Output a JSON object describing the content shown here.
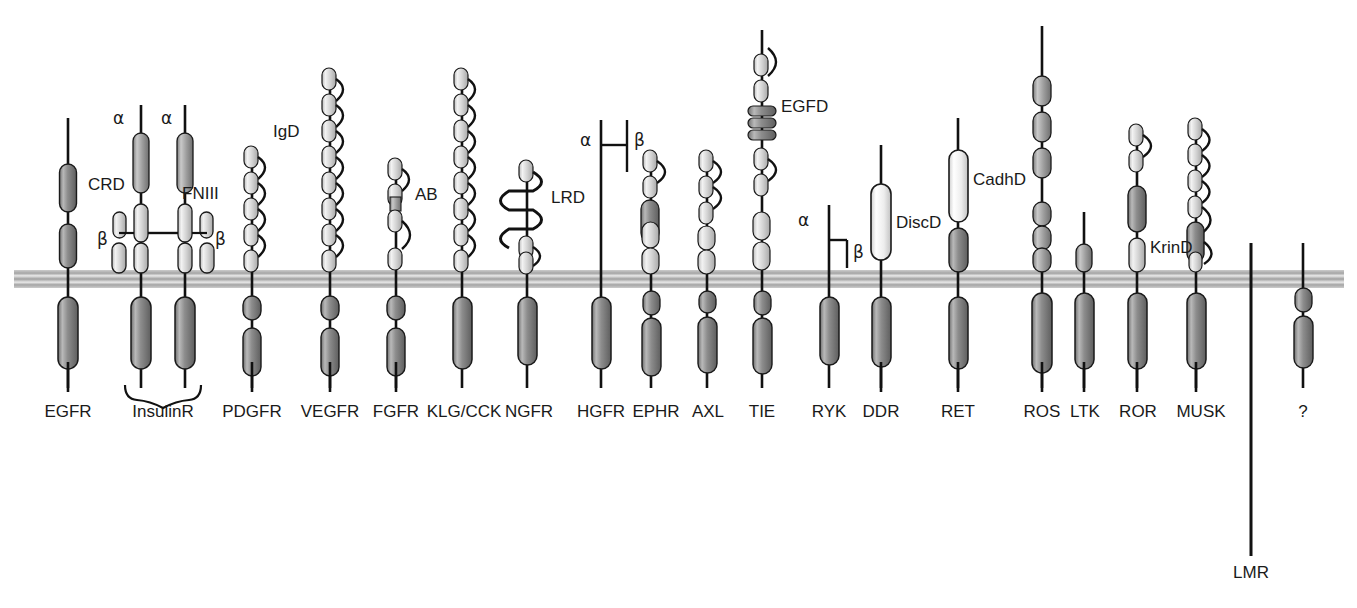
{
  "figure": {
    "membrane": {
      "color": "#b3b3b3",
      "y": 270,
      "height": 18
    },
    "colors": {
      "stalk": "#111111",
      "kinase_dark": "#8a8a8a",
      "ig_light": "#d9d9d9",
      "domain_mid": "#9a9a9a",
      "domain_white": "#f5f5f5",
      "outline": "#1a1a1a",
      "text": "#1a1a1a"
    }
  },
  "domain_labels": [
    {
      "id": "crd",
      "text": "CRD",
      "x": 88,
      "y": 190
    },
    {
      "id": "alpha1",
      "text": "α",
      "x": 113,
      "y": 124
    },
    {
      "id": "alpha2",
      "text": "α",
      "x": 161,
      "y": 124
    },
    {
      "id": "fniii",
      "text": "FNIII",
      "x": 182,
      "y": 199
    },
    {
      "id": "beta1",
      "text": "β",
      "x": 110,
      "y": 245
    },
    {
      "id": "beta2",
      "text": "β",
      "x": 196,
      "y": 245
    },
    {
      "id": "igd",
      "text": "IgD",
      "x": 273,
      "y": 137
    },
    {
      "id": "ab",
      "text": "AB",
      "x": 415,
      "y": 200
    },
    {
      "id": "lrd",
      "text": "LRD",
      "x": 551,
      "y": 203
    },
    {
      "id": "hgfr_alpha",
      "text": "α",
      "x": 608,
      "y": 146
    },
    {
      "id": "hgfr_beta",
      "text": "β",
      "x": 648,
      "y": 146
    },
    {
      "id": "egfd",
      "text": "EGFD",
      "x": 776,
      "y": 112
    },
    {
      "id": "ryk_alpha",
      "text": "α",
      "x": 806,
      "y": 223
    },
    {
      "id": "ryk_beta",
      "text": "β",
      "x": 849,
      "y": 255
    },
    {
      "id": "discd",
      "text": "DiscD",
      "x": 898,
      "y": 226
    },
    {
      "id": "cadhd",
      "text": "CadhD",
      "x": 972,
      "y": 183
    },
    {
      "id": "krind",
      "text": "KrinD",
      "x": 1128,
      "y": 251
    }
  ],
  "receptors": [
    {
      "id": "egfr",
      "label": "EGFR",
      "x": 68,
      "label_x": 68,
      "tick": true
    },
    {
      "id": "insulinr",
      "label": "InsulinR",
      "x": 163,
      "label_x": 163,
      "tick": false,
      "bracket": true
    },
    {
      "id": "pdgfr",
      "label": "PDGFR",
      "x": 252,
      "label_x": 252,
      "tick": true
    },
    {
      "id": "vegfr",
      "label": "VEGFR",
      "x": 330,
      "label_x": 330,
      "tick": true
    },
    {
      "id": "fgfr",
      "label": "FGFR",
      "x": 396,
      "label_x": 396,
      "tick": true
    },
    {
      "id": "klgcck",
      "label": "KLG/CCK",
      "x": 462,
      "label_x": 464,
      "tick": false
    },
    {
      "id": "ngfr",
      "label": "NGFR",
      "x": 527,
      "label_x": 527,
      "tick": false
    },
    {
      "id": "hgfr",
      "label": "HGFR",
      "x": 601,
      "label_x": 601,
      "tick": true
    },
    {
      "id": "ephr",
      "label": "EPHR",
      "x": 651,
      "label_x": 655,
      "tick": false
    },
    {
      "id": "axl",
      "label": "AXL",
      "x": 707,
      "label_x": 707,
      "tick": false
    },
    {
      "id": "tie",
      "label": "TIE",
      "x": 762,
      "label_x": 762,
      "tick": false
    },
    {
      "id": "ryk",
      "label": "RYK",
      "x": 829,
      "label_x": 829,
      "tick": false
    },
    {
      "id": "ddr",
      "label": "DDR",
      "x": 881,
      "label_x": 881,
      "tick": true
    },
    {
      "id": "ret",
      "label": "RET",
      "x": 958,
      "label_x": 958,
      "tick": true
    },
    {
      "id": "ros",
      "label": "ROS",
      "x": 1042,
      "label_x": 1042,
      "tick": true
    },
    {
      "id": "ltk",
      "label": "LTK",
      "x": 1084,
      "label_x": 1084,
      "tick": true
    },
    {
      "id": "ror",
      "label": "ROR",
      "x": 1137,
      "label_x": 1137,
      "tick": true
    },
    {
      "id": "musk",
      "label": "MUSK",
      "x": 1196,
      "label_x": 1201,
      "tick": true
    },
    {
      "id": "lmr",
      "label": "LMR",
      "x": 1251,
      "label_x": 1251,
      "tick": false,
      "long_line": true,
      "label_y": 578
    },
    {
      "id": "unknown",
      "label": "?",
      "x": 1303,
      "label_x": 1303,
      "tick": false
    }
  ],
  "label_row": {
    "y": 411
  }
}
